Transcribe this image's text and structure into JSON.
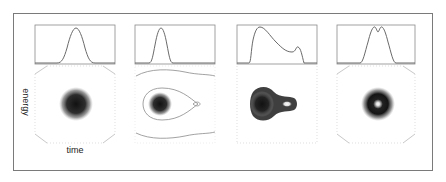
{
  "figure": {
    "axis_labels": {
      "y": "energy",
      "x": "time"
    },
    "colors": {
      "frame": "#7a7a7a",
      "plot_line": "#6a6a6a",
      "dashed_box": "#d8d8d8",
      "contour": "#8a8a8a",
      "density": "#1a1a1a"
    },
    "panels": [
      {
        "id": 1,
        "profile": "single gaussian peak",
        "phase_space": "round dark blob (centered)"
      },
      {
        "id": 2,
        "profile": "narrow single peak (left-shifted)",
        "phase_space": "dark blob inside teardrop separatrix contour with outer contours"
      },
      {
        "id": 3,
        "profile": "asymmetric peak with shoulder on right",
        "phase_space": "elongated blob with bright spot on right"
      },
      {
        "id": 4,
        "profile": "double-humped (flat top with dip)",
        "phase_space": "dark ring with bright center"
      }
    ]
  }
}
